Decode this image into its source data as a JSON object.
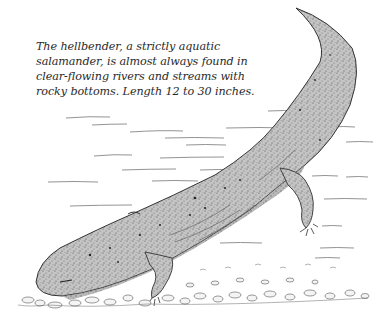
{
  "figure": {
    "caption": "The hellbender, a strictly aquatic salamander, is almost always found in clear-flowing rivers and streams with rocky bottoms. Length 12 to 30 inches.",
    "style": "stippled pen-and-ink",
    "colors": {
      "background": "#ffffff",
      "ink": "#2a2a2a",
      "body_fill": "#b8b8b8",
      "water_lines": "#777777"
    }
  }
}
